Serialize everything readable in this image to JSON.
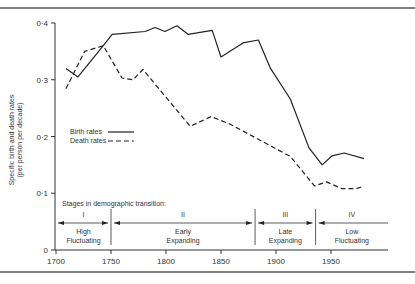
{
  "chart_data": {
    "type": "line",
    "title": "",
    "xlabel": "",
    "ylabel": "Specific birth and death rates (per person per decade)",
    "ylabel_line1": "Specific birth and death rates",
    "ylabel_line2": "(per person per decade)",
    "xlim": [
      1700,
      1990
    ],
    "ylim": [
      0,
      0.4
    ],
    "x_ticks": [
      1700,
      1750,
      1800,
      1850,
      1900,
      1950
    ],
    "x_tick_labels": [
      "1700",
      "1750",
      "1800",
      "1850",
      "1900",
      "1950"
    ],
    "y_ticks": [
      0,
      0.1,
      0.2,
      0.3,
      0.4
    ],
    "y_tick_labels": [
      "0",
      "0·1",
      "0·2",
      "0·3",
      "0·4"
    ],
    "grid": false,
    "legend_position": "left-middle",
    "series": [
      {
        "name": "Birth rates",
        "style": "solid",
        "x": [
          1709,
          1720,
          1743,
          1751,
          1781,
          1790,
          1799,
          1810,
          1820,
          1842,
          1850,
          1870,
          1884,
          1895,
          1913,
          1930,
          1942,
          1951,
          1962,
          1980
        ],
        "values": [
          0.32,
          0.305,
          0.36,
          0.38,
          0.385,
          0.392,
          0.385,
          0.395,
          0.38,
          0.387,
          0.34,
          0.365,
          0.37,
          0.32,
          0.266,
          0.18,
          0.15,
          0.166,
          0.171,
          0.161
        ]
      },
      {
        "name": "Death rates",
        "style": "dashed",
        "x": [
          1709,
          1726,
          1743,
          1760,
          1770,
          1779,
          1822,
          1841,
          1858,
          1913,
          1935,
          1946,
          1960,
          1973,
          1980
        ],
        "values": [
          0.284,
          0.35,
          0.36,
          0.303,
          0.3,
          0.318,
          0.218,
          0.235,
          0.222,
          0.165,
          0.113,
          0.12,
          0.108,
          0.108,
          0.113
        ]
      }
    ],
    "annotations": {
      "stages_title": "Stages in demographic transition:",
      "stages": [
        {
          "numeral": "I",
          "line1": "High",
          "line2": "Fluctuating",
          "start": 1700,
          "end": 1750
        },
        {
          "numeral": "II",
          "line1": "Early",
          "line2": "Expanding",
          "start": 1750,
          "end": 1881
        },
        {
          "numeral": "III",
          "line1": "Late",
          "line2": "Expanding",
          "start": 1881,
          "end": 1936
        },
        {
          "numeral": "IV",
          "line1": "Low",
          "line2": "Fluctuating",
          "start": 1936,
          "end": 1990
        }
      ]
    }
  },
  "legend": {
    "birth": "Birth rates",
    "death": "Death rates"
  }
}
